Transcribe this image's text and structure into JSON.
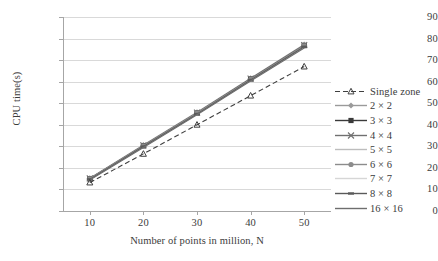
{
  "chart_data": {
    "type": "line",
    "title": "",
    "xlabel": "Number of points in million, N",
    "ylabel": "CPU time(s)",
    "x": [
      10,
      20,
      30,
      40,
      50
    ],
    "xticklabels": [
      "10",
      "20",
      "30",
      "40",
      "50"
    ],
    "yticklabels": [
      "0",
      "10",
      "20",
      "30",
      "40",
      "50",
      "60",
      "70",
      "80",
      "90"
    ],
    "xlim": [
      5,
      55
    ],
    "ylim": [
      0,
      90
    ],
    "grid": "horizontal",
    "legend_position": "right",
    "series": [
      {
        "name": "Single zone",
        "style": "dashed",
        "marker": "triangle",
        "color": "#3f3f3f",
        "values": [
          13.2,
          26.5,
          40.0,
          53.5,
          67.0
        ]
      },
      {
        "name": "2 × 2",
        "style": "solid",
        "marker": "diamond",
        "color": "#9a9a9a",
        "values": [
          15.2,
          30.6,
          45.8,
          61.6,
          77.2
        ]
      },
      {
        "name": "3 × 3",
        "style": "solid",
        "marker": "square",
        "color": "#3a3a3a",
        "values": [
          15.0,
          30.2,
          45.4,
          61.2,
          76.8
        ]
      },
      {
        "name": "4 × 4",
        "style": "solid",
        "marker": "cross",
        "color": "#707070",
        "values": [
          15.1,
          30.4,
          45.6,
          61.4,
          77.0
        ]
      },
      {
        "name": "5 × 5",
        "style": "solid",
        "marker": "none",
        "color": "#bdbdbd",
        "values": [
          14.8,
          30.0,
          45.2,
          60.9,
          76.4
        ]
      },
      {
        "name": "6 × 6",
        "style": "solid",
        "marker": "circle",
        "color": "#8c8c8c",
        "values": [
          14.9,
          30.1,
          45.3,
          61.0,
          76.6
        ]
      },
      {
        "name": "7 × 7",
        "style": "solid",
        "marker": "none",
        "color": "#d6d6d6",
        "values": [
          14.6,
          29.7,
          44.9,
          60.6,
          76.0
        ]
      },
      {
        "name": "8 × 8",
        "style": "solid",
        "marker": "dash",
        "color": "#5a5a5a",
        "values": [
          14.7,
          29.9,
          45.0,
          60.8,
          76.2
        ]
      },
      {
        "name": "16 × 16",
        "style": "solid",
        "marker": "none",
        "color": "#6e6e6e",
        "values": [
          14.4,
          29.5,
          44.6,
          60.3,
          75.6
        ]
      }
    ]
  },
  "axis": {
    "x_title": "Number of points in million, N",
    "y_title": "CPU time(s)"
  }
}
